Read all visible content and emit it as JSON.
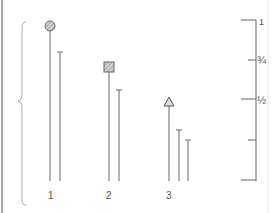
{
  "diagram": {
    "type": "stem-comparison",
    "groups": [
      {
        "label": "1",
        "marker": "circle-hatched",
        "marker_height": 0.95,
        "secondary_heights": [
          0.8
        ]
      },
      {
        "label": "2",
        "marker": "square-hatched",
        "marker_height": 0.7,
        "secondary_heights": [
          0.56
        ]
      },
      {
        "label": "3",
        "marker": "triangle",
        "marker_height": 0.5,
        "secondary_heights": [
          0.31,
          0.25
        ]
      }
    ],
    "scale": {
      "ticks": [
        {
          "label": "1",
          "value": 1
        },
        {
          "label": "¾",
          "value": 0.75
        },
        {
          "label": "½",
          "value": 0.5
        },
        {
          "label": "",
          "value": 0.25
        },
        {
          "label": "",
          "value": 0
        }
      ]
    },
    "colors": {
      "line": "#666666",
      "marker_fill": "#b0b0b0",
      "border": "#888888",
      "light_border": "#e0e0e0"
    }
  }
}
